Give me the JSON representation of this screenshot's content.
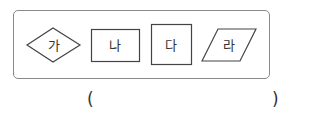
{
  "figures": [
    {
      "id": "ga",
      "label": "가",
      "shape": "diamond"
    },
    {
      "id": "na",
      "label": "나",
      "shape": "rectangle"
    },
    {
      "id": "da",
      "label": "다",
      "shape": "square"
    },
    {
      "id": "ra",
      "label": "라",
      "shape": "parallelogram"
    }
  ],
  "answer": {
    "open": "(",
    "close": ")",
    "value": ""
  },
  "colors": {
    "stroke": "#444444",
    "frame": "#8a8a8a",
    "text": "#333333"
  }
}
